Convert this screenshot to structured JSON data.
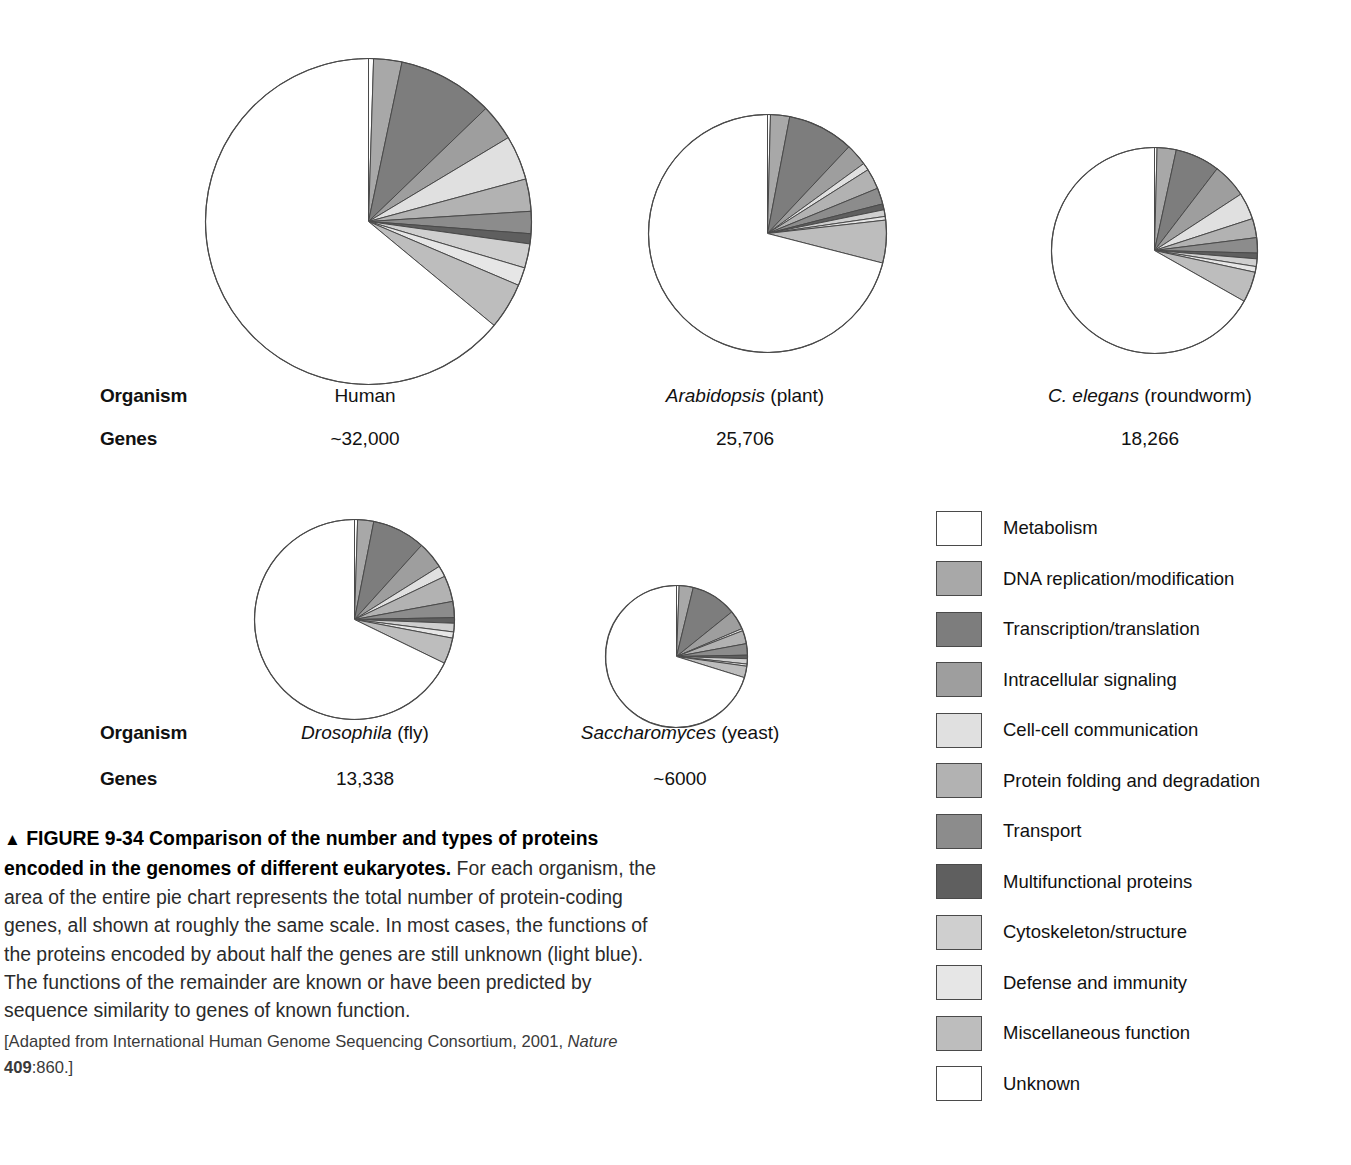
{
  "figure": {
    "number": "FIGURE 9-34",
    "marker": "▲",
    "title": "Comparison of the number and types of proteins encoded in the genomes of different eukaryotes.",
    "body": " For each organism, the area of the entire pie chart represents the total number of protein-coding genes, all shown at roughly the same scale. In most cases, the functions of the proteins encoded by about half the genes are still unknown (light blue). The functions of the remainder are known or have been predicted by sequence similarity to genes of known function.",
    "source_prefix": "[Adapted from International Human Genome Sequencing Consortium, 2001, ",
    "source_journal": "Nature",
    "source_volume": "409",
    "source_suffix": ":860.]"
  },
  "row_labels": {
    "organism": "Organism",
    "genes": "Genes"
  },
  "chart_data": {
    "type": "pie",
    "title": "Comparison of the number and types of proteins encoded in the genomes of different eukaryotes",
    "note": "Each pie's area is proportional to the organism's total protein-coding gene count; slices begin at 12 o'clock and run clockwise.",
    "categories": [
      "Metabolism",
      "DNA replication/modification",
      "Transcription/translation",
      "Intracellular signaling",
      "Cell-cell communication",
      "Protein folding and degradation",
      "Transport",
      "Multifunctional proteins",
      "Cytoskeleton/structure",
      "Defense and immunity",
      "Miscellaneous function",
      "Unknown"
    ],
    "colors": [
      "#ffffff",
      "#a8a8a8",
      "#7d7d7d",
      "#9e9e9e",
      "#e0e0e0",
      "#b2b2b2",
      "#8c8c8c",
      "#5f5f5f",
      "#cfcfcf",
      "#e6e6e6",
      "#bdbdbd",
      "#ffffff"
    ],
    "legend_position": "right",
    "series": [
      {
        "name": "Human",
        "genes_label": "~32,000",
        "genes": 32000,
        "values": [
          0.5,
          2.8,
          9.5,
          3.6,
          4.4,
          3.2,
          2.2,
          1.0,
          2.4,
          1.8,
          4.6,
          64.0
        ]
      },
      {
        "name": "Arabidopsis (plant)",
        "genes_label": "25,706",
        "genes": 25706,
        "values": [
          0.4,
          2.6,
          9.0,
          3.0,
          1.0,
          2.8,
          2.2,
          0.8,
          0.9,
          0.5,
          5.8,
          71.0
        ]
      },
      {
        "name": "C. elegans (roundworm)",
        "genes_label": "18,266",
        "genes": 18266,
        "values": [
          0.4,
          3.0,
          7.0,
          5.4,
          4.2,
          3.0,
          2.4,
          0.9,
          1.2,
          0.9,
          4.8,
          66.8
        ]
      },
      {
        "name": "Drosophila (fly)",
        "genes_label": "13,338",
        "genes": 13338,
        "values": [
          0.5,
          2.6,
          8.6,
          4.4,
          1.8,
          4.2,
          2.6,
          0.9,
          1.4,
          1.0,
          4.2,
          67.8
        ]
      },
      {
        "name": "Saccharomyces (yeast)",
        "genes_label": "~6000",
        "genes": 6000,
        "values": [
          0.6,
          3.2,
          10.4,
          4.4,
          0.5,
          3.0,
          2.6,
          0.8,
          1.2,
          0.5,
          2.6,
          70.2
        ]
      }
    ]
  },
  "organisms": [
    {
      "id": "human",
      "name_plain": "Human",
      "name_italic": "",
      "name_suffix": "",
      "genes": "~32,000"
    },
    {
      "id": "arabidopsis",
      "name_plain": "",
      "name_italic": "Arabidopsis",
      "name_suffix": " (plant)",
      "genes": "25,706"
    },
    {
      "id": "celegans",
      "name_plain": "",
      "name_italic": "C. elegans",
      "name_suffix": " (roundworm)",
      "genes": "18,266"
    },
    {
      "id": "drosophila",
      "name_plain": "",
      "name_italic": "Drosophila",
      "name_suffix": " (fly)",
      "genes": "13,338"
    },
    {
      "id": "yeast",
      "name_plain": "",
      "name_italic": "Saccharomyces",
      "name_suffix": " (yeast)",
      "genes": "~6000"
    }
  ],
  "legend": {
    "items": [
      {
        "label": "Metabolism",
        "color": "#ffffff"
      },
      {
        "label": "DNA replication/modification",
        "color": "#a8a8a8"
      },
      {
        "label": "Transcription/translation",
        "color": "#7d7d7d"
      },
      {
        "label": "Intracellular signaling",
        "color": "#9e9e9e"
      },
      {
        "label": "Cell-cell communication",
        "color": "#e0e0e0"
      },
      {
        "label": "Protein folding and degradation",
        "color": "#b2b2b2"
      },
      {
        "label": "Transport",
        "color": "#8c8c8c"
      },
      {
        "label": "Multifunctional proteins",
        "color": "#5f5f5f"
      },
      {
        "label": "Cytoskeleton/structure",
        "color": "#cfcfcf"
      },
      {
        "label": "Defense and immunity",
        "color": "#e6e6e6"
      },
      {
        "label": "Miscellaneous function",
        "color": "#bdbdbd"
      },
      {
        "label": "Unknown",
        "color": "#ffffff"
      }
    ]
  }
}
